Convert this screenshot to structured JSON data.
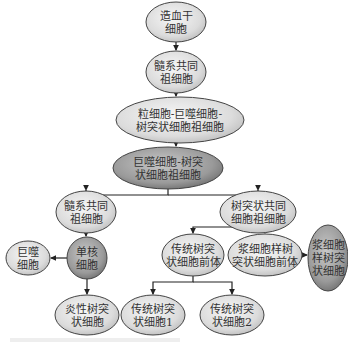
{
  "colors": {
    "light_fill_inner": "#f4f4f4",
    "light_fill_outer": "#c6c6c6",
    "dark_fill_inner": "#bdbdbd",
    "dark_fill_outer": "#7d7d7d",
    "stroke": "#444444",
    "edge": "#222222"
  },
  "nodes": [
    {
      "id": "hsc",
      "lines": [
        "造血干",
        "细胞"
      ],
      "cx": 176,
      "cy": 22,
      "rx": 30,
      "ry": 20,
      "dark": false
    },
    {
      "id": "cmp",
      "lines": [
        "髓系共同",
        "祖细胞"
      ],
      "cx": 176,
      "cy": 72,
      "rx": 30,
      "ry": 21,
      "dark": false
    },
    {
      "id": "gmdp",
      "lines": [
        "粒细胞-巨噬细胞-",
        "树突状细胞祖细胞"
      ],
      "cx": 180,
      "cy": 120,
      "rx": 64,
      "ry": 23,
      "dark": false
    },
    {
      "id": "mdp",
      "lines": [
        "巨噬细胞-树突",
        "状细胞祖细胞"
      ],
      "cx": 168,
      "cy": 168,
      "rx": 55,
      "ry": 21,
      "dark": true
    },
    {
      "id": "cmp2",
      "lines": [
        "髓系共同",
        "祖细胞"
      ],
      "cx": 86,
      "cy": 212,
      "rx": 30,
      "ry": 21,
      "dark": false
    },
    {
      "id": "cdp",
      "lines": [
        "树突状共同",
        "细胞祖细胞"
      ],
      "cx": 258,
      "cy": 212,
      "rx": 38,
      "ry": 21,
      "dark": false
    },
    {
      "id": "mono",
      "lines": [
        "单核",
        "细胞"
      ],
      "cx": 87,
      "cy": 258,
      "rx": 20,
      "ry": 21,
      "dark": true
    },
    {
      "id": "mac",
      "lines": [
        "巨噬",
        "细胞"
      ],
      "cx": 28,
      "cy": 258,
      "rx": 22,
      "ry": 17,
      "dark": false
    },
    {
      "id": "precdc",
      "lines": [
        "传统树突",
        "状细胞前体"
      ],
      "cx": 193,
      "cy": 255,
      "rx": 31,
      "ry": 21,
      "dark": false
    },
    {
      "id": "prepdc",
      "lines": [
        "浆细胞样树",
        "突状细胞前体"
      ],
      "cx": 265,
      "cy": 255,
      "rx": 37,
      "ry": 21,
      "dark": false
    },
    {
      "id": "pdc",
      "lines": [
        "浆细胞",
        "样树突",
        "状细胞"
      ],
      "cx": 328,
      "cy": 258,
      "rx": 20,
      "ry": 33,
      "dark": true
    },
    {
      "id": "infdc",
      "lines": [
        "炎性树突",
        "状细胞"
      ],
      "cx": 87,
      "cy": 315,
      "rx": 32,
      "ry": 20,
      "dark": false
    },
    {
      "id": "cdc1",
      "lines": [
        "传统树突",
        "状细胞1"
      ],
      "cx": 153,
      "cy": 315,
      "rx": 32,
      "ry": 20,
      "dark": false
    },
    {
      "id": "cdc2",
      "lines": [
        "传统树突",
        "状细胞2"
      ],
      "cx": 232,
      "cy": 315,
      "rx": 32,
      "ry": 20,
      "dark": false
    }
  ],
  "edges": [
    {
      "from": "hsc",
      "to": "cmp",
      "path": "M176 42 L176 50",
      "arrow": [
        176,
        51,
        "down"
      ]
    },
    {
      "from": "cmp",
      "to": "gmdp",
      "path": "M176 93 L176 96",
      "arrow": [
        176,
        97,
        "down"
      ]
    },
    {
      "from": "gmdp",
      "to": "mdp",
      "path": "M176 143 L176 146",
      "arrow": [
        176,
        147,
        "down"
      ]
    },
    {
      "from": "mdp",
      "to": "cmp2",
      "path": "M168 189 L168 195 L86 195 L86 190",
      "arrow": [
        86,
        191,
        "down"
      ]
    },
    {
      "from": "mdp",
      "to": "cdp",
      "path": "M168 195 L258 195 L258 190",
      "arrow": [
        258,
        191,
        "down"
      ]
    },
    {
      "from": "cmp2",
      "to": "mono",
      "path": "M86 233 L86 236",
      "arrow": [
        86,
        237,
        "down"
      ]
    },
    {
      "from": "mono",
      "to": "mac",
      "path": "M67 258 L51 258",
      "arrow": [
        50,
        258,
        "left"
      ]
    },
    {
      "from": "mono",
      "to": "infdc",
      "path": "M87 279 L87 294",
      "arrow": [
        87,
        295,
        "down"
      ]
    },
    {
      "from": "cdp",
      "to": "precdc",
      "path": "M258 233 L258 227 L193 227 L193 233",
      "arrow": [
        193,
        234,
        "down"
      ]
    },
    {
      "from": "cdp",
      "to": "prepdc",
      "path": "M258 227 L265 227 L265 233",
      "arrow": [
        265,
        234,
        "down"
      ]
    },
    {
      "from": "prepdc",
      "to": "pdc",
      "path": "M302 255 L307 255",
      "arrow": [
        308,
        255,
        "right"
      ]
    },
    {
      "from": "precdc",
      "to": "cdc1",
      "path": "M193 276 L193 282 L153 282 L153 294",
      "arrow": [
        153,
        295,
        "down"
      ]
    },
    {
      "from": "precdc",
      "to": "cdc2",
      "path": "M193 282 L232 282 L232 294",
      "arrow": [
        232,
        295,
        "down"
      ]
    }
  ]
}
